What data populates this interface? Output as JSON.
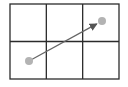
{
  "diagram": {
    "type": "grid-with-vector",
    "grid": {
      "x": 10,
      "y": 4,
      "width": 109,
      "height": 75,
      "columns": 3,
      "rows": 2,
      "line_color": "#2b2b2b",
      "line_width": 1.3
    },
    "vector": {
      "start": {
        "x": 29,
        "y": 61
      },
      "end": {
        "x": 102,
        "y": 21
      },
      "color": "#666666",
      "point_color": "#b3b3b3",
      "point_radius": 4
    }
  }
}
